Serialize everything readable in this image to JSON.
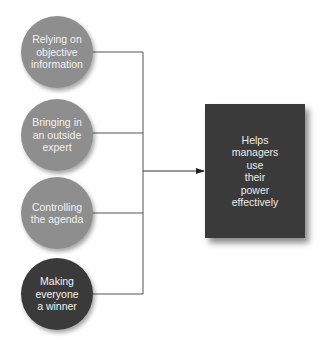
{
  "diagram": {
    "type": "flow",
    "inputs": [
      {
        "id": "objective-info",
        "label": "Relying on\nobjective\ninformation",
        "fill": "#8e8e8e"
      },
      {
        "id": "outside-expert",
        "label": "Bringing in\nan outside\nexpert",
        "fill": "#8e8e8e"
      },
      {
        "id": "controlling-agenda",
        "label": "Controlling\nthe agenda",
        "fill": "#8e8e8e"
      },
      {
        "id": "everyone-winner",
        "label": "Making\neveryone\na winner",
        "fill": "#3a3a3a"
      }
    ],
    "output": {
      "id": "effective-power",
      "label": "Helps\nmanagers\nuse\ntheir\npower\neffectively",
      "fill": "#3a3a3a"
    },
    "connector_color": "#555555",
    "edges": [
      {
        "from": "objective-info",
        "to": "effective-power"
      },
      {
        "from": "outside-expert",
        "to": "effective-power"
      },
      {
        "from": "controlling-agenda",
        "to": "effective-power"
      },
      {
        "from": "everyone-winner",
        "to": "effective-power"
      }
    ]
  }
}
